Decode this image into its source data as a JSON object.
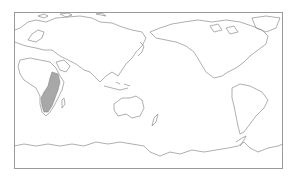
{
  "map": {
    "type": "world-outline-map",
    "projection": "equirectangular, Pacific-centered",
    "frame": {
      "left": 14,
      "top": 12,
      "width": 269,
      "height": 157
    },
    "colors": {
      "background": "#ffffff",
      "coastline": "#8c8c8c",
      "frame": "#9a9a9a",
      "distribution_fill": "#a8a8a8"
    },
    "highlighted_region": {
      "name": "distribution-range",
      "description": "Shaded range in eastern and southern Africa"
    }
  }
}
